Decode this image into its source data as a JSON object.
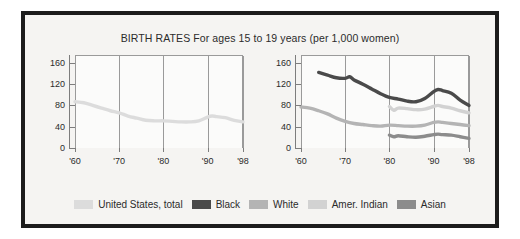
{
  "chart_data": {
    "type": "line",
    "title": "BIRTH RATES For ages 15 to 19 years (per 1,000 women)",
    "xlabel": "",
    "ylabel": "",
    "xlim": [
      1960,
      1998
    ],
    "ylim": [
      0,
      175
    ],
    "yticks": [
      0,
      40,
      80,
      120,
      160
    ],
    "xticks": [
      1960,
      1970,
      1980,
      1990,
      1998
    ],
    "xtick_labels": [
      "'60",
      "'70",
      "'80",
      "'90",
      "'98"
    ],
    "grid": "vertical gridlines at each x tick",
    "legend_position": "bottom-center",
    "panels": [
      {
        "name": "left-panel",
        "series": [
          {
            "name": "United States, total",
            "color": "#dcdcdc",
            "x": [
              1960,
              1962,
              1964,
              1966,
              1968,
              1970,
              1972,
              1974,
              1976,
              1978,
              1980,
              1982,
              1984,
              1986,
              1988,
              1990,
              1991,
              1992,
              1994,
              1996,
              1998
            ],
            "values": [
              89,
              87,
              82,
              77,
              72,
              68,
              62,
              58,
              54,
              53,
              53,
              52,
              51,
              51,
              53,
              60,
              62,
              61,
              59,
              54,
              51
            ]
          }
        ]
      },
      {
        "name": "right-panel",
        "series": [
          {
            "name": "Black",
            "color": "#4a4a4a",
            "x": [
              1964,
              1966,
              1968,
              1970,
              1971,
              1972,
              1974,
              1976,
              1978,
              1980,
              1982,
              1984,
              1986,
              1988,
              1990,
              1991,
              1992,
              1994,
              1996,
              1998
            ],
            "values": [
              144,
              139,
              134,
              133,
              136,
              130,
              122,
              113,
              104,
              97,
              94,
              90,
              89,
              95,
              108,
              112,
              110,
              105,
              92,
              82
            ]
          },
          {
            "name": "White",
            "color": "#b4b4b4",
            "x": [
              1960,
              1962,
              1964,
              1966,
              1968,
              1970,
              1972,
              1974,
              1976,
              1978,
              1980,
              1982,
              1984,
              1986,
              1988,
              1990,
              1991,
              1992,
              1994,
              1996,
              1998
            ],
            "values": [
              79,
              77,
              72,
              66,
              58,
              52,
              48,
              46,
              44,
              43,
              45,
              44,
              43,
              43,
              45,
              50,
              51,
              50,
              48,
              46,
              44
            ]
          },
          {
            "name": "Amer. Indian",
            "color": "#d2d2d2",
            "x": [
              1980,
              1981,
              1982,
              1984,
              1986,
              1988,
              1990,
              1991,
              1992,
              1994,
              1996,
              1998
            ],
            "values": [
              80,
              73,
              77,
              76,
              74,
              75,
              80,
              82,
              80,
              77,
              72,
              68
            ]
          },
          {
            "name": "Asian",
            "color": "#8c8c8c",
            "x": [
              1980,
              1981,
              1982,
              1984,
              1986,
              1988,
              1990,
              1991,
              1992,
              1994,
              1996,
              1998
            ],
            "values": [
              26,
              23,
              25,
              23,
              22,
              24,
              27,
              28,
              27,
              26,
              23,
              20
            ]
          }
        ]
      }
    ]
  },
  "title": "BIRTH RATES For ages 15 to 19 years (per 1,000 women)",
  "axes": {
    "ytick_labels": [
      "160",
      "120",
      "80",
      "40",
      "0"
    ],
    "xtick_labels": [
      "'60",
      "'70",
      "'80",
      "'90",
      "'98"
    ]
  },
  "legend": {
    "items": [
      {
        "label": "United States, total",
        "color": "#dcdcdc"
      },
      {
        "label": "Black",
        "color": "#4a4a4a"
      },
      {
        "label": "White",
        "color": "#b4b4b4"
      },
      {
        "label": "Amer. Indian",
        "color": "#d2d2d2"
      },
      {
        "label": "Asian",
        "color": "#8c8c8c"
      }
    ]
  },
  "colors": {
    "border": "#1c1c1c",
    "background": "#f5f4f2",
    "plot_background": "#fbfbfa",
    "axis": "#7d7d7d",
    "gridline": "#9a9a9a",
    "text": "#2b2b2b"
  }
}
